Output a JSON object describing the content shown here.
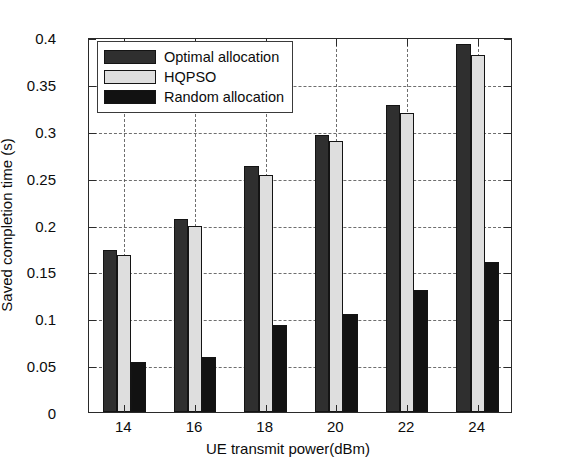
{
  "chart_data": {
    "type": "bar",
    "title": "",
    "xlabel": "UE transmit power(dBm)",
    "ylabel": "Saved completion time (s)",
    "categories": [
      "14",
      "16",
      "18",
      "20",
      "22",
      "24"
    ],
    "series": [
      {
        "name": "Optimal allocation",
        "color": "#2f2f2f",
        "values": [
          0.173,
          0.206,
          0.262,
          0.295,
          0.327,
          0.393
        ]
      },
      {
        "name": "HQPSO",
        "color": "#dedede",
        "values": [
          0.167,
          0.198,
          0.253,
          0.289,
          0.319,
          0.381
        ]
      },
      {
        "name": "Random allocation",
        "color": "#121212",
        "values": [
          0.053,
          0.059,
          0.093,
          0.105,
          0.13,
          0.16
        ]
      }
    ],
    "ylim": [
      0,
      0.4
    ],
    "ytick_values": [
      0,
      0.05,
      0.1,
      0.15,
      0.2,
      0.25,
      0.3,
      0.35,
      0.4
    ],
    "ytick_labels": [
      "0",
      "0.05",
      "0.1",
      "0.15",
      "0.2",
      "0.25",
      "0.3",
      "0.35",
      "0.4"
    ],
    "grid": true,
    "grid_style": "dashed",
    "legend_position": "upper left",
    "frame_color": "#2a2a2a",
    "background": "#ffffff"
  }
}
